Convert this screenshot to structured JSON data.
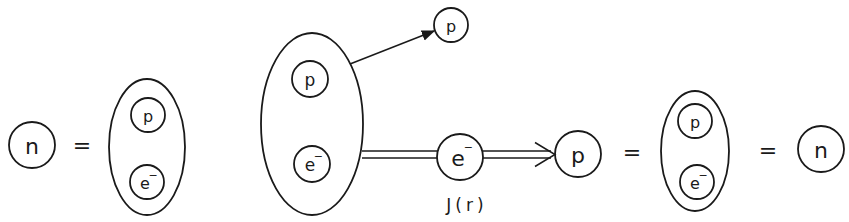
{
  "diagram": {
    "type": "particle-decomposition",
    "stroke_color": "#1a1a1a",
    "background": "#ffffff",
    "particles": [
      {
        "id": "n-left",
        "label": "n",
        "cx": 32,
        "cy": 145,
        "r": 23
      },
      {
        "id": "p-top",
        "label": "p",
        "cx": 451,
        "cy": 25,
        "r": 17
      },
      {
        "id": "e-mid",
        "label": "e",
        "sup": "−",
        "cx": 460,
        "cy": 157,
        "r": 23
      },
      {
        "id": "p-mid",
        "label": "p",
        "cx": 578,
        "cy": 154,
        "r": 23
      },
      {
        "id": "n-right",
        "label": "n",
        "cx": 821,
        "cy": 149,
        "r": 23
      }
    ],
    "composites": [
      {
        "id": "composite-left",
        "cx": 147,
        "cy": 147,
        "rx": 38,
        "ry": 68,
        "members": [
          {
            "label": "p",
            "cx": 148,
            "cy": 115,
            "r": 17
          },
          {
            "label": "e",
            "sup": "−",
            "cx": 147,
            "cy": 182,
            "r": 17
          }
        ]
      },
      {
        "id": "composite-center",
        "cx": 312,
        "cy": 124,
        "rx": 51,
        "ry": 91,
        "members": [
          {
            "label": "p",
            "cx": 310,
            "cy": 79,
            "r": 18
          },
          {
            "label": "e",
            "sup": "−",
            "cx": 312,
            "cy": 164,
            "r": 18
          }
        ]
      },
      {
        "id": "composite-right",
        "cx": 695,
        "cy": 151,
        "rx": 34,
        "ry": 60,
        "members": [
          {
            "label": "p",
            "cx": 695,
            "cy": 121,
            "r": 17
          },
          {
            "label": "e",
            "sup": "−",
            "cx": 697,
            "cy": 182,
            "r": 17
          }
        ]
      }
    ],
    "equals_signs": [
      {
        "id": "eq-1",
        "symbol": "=",
        "x": 82,
        "y": 145
      },
      {
        "id": "eq-2",
        "symbol": "=",
        "x": 632,
        "y": 152
      },
      {
        "id": "eq-3",
        "symbol": "=",
        "x": 768,
        "y": 150
      }
    ],
    "arrows": [
      {
        "id": "arrow-proton-emission",
        "style": "single",
        "x1": 350,
        "y1": 64,
        "x2": 434,
        "y2": 31
      },
      {
        "id": "line-electron-propagator",
        "style": "double-line",
        "x1": 362,
        "y1": 154.5,
        "x2": 437,
        "y2": 154.5,
        "gap": 7
      },
      {
        "id": "arrow-electron-to-proton",
        "style": "double-arrow",
        "x1": 483,
        "y1": 154.5,
        "x2": 555,
        "y2": 154.5,
        "gap": 7
      }
    ],
    "caption": {
      "text": "J(r)",
      "x": 467,
      "y": 211
    }
  }
}
